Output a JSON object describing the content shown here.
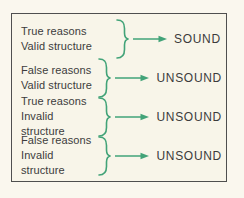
{
  "diagram": {
    "rows": [
      {
        "line1": "True reasons",
        "line2": "Valid structure",
        "result": "SOUND"
      },
      {
        "line1": "False reasons",
        "line2": "Valid structure",
        "result": "UNSOUND"
      },
      {
        "line1": "True reasons",
        "line2": "Invalid structure",
        "result": "UNSOUND"
      },
      {
        "line1": "False reasons",
        "line2": "Invalid structure",
        "result": "UNSOUND"
      }
    ],
    "icons": {
      "brace": "right-curly-brace-icon",
      "arrow": "right-arrow-icon"
    },
    "colors": {
      "accent_green": "#42a378",
      "text": "#3c3c3c",
      "box_background": "#f8f5e9",
      "page_background": "#faf7ee",
      "border": "#4f4f4f"
    }
  }
}
